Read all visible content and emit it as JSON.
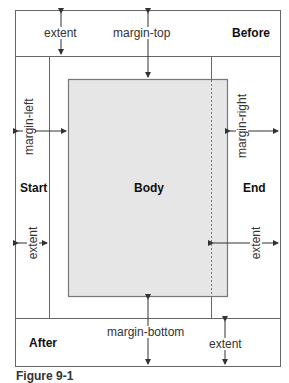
{
  "diagram": {
    "regions": {
      "before": "Before",
      "start": "Start",
      "body": "Body",
      "end": "End",
      "after": "After"
    },
    "dimensions": {
      "margin_top": "margin-top",
      "margin_bottom": "margin-bottom",
      "margin_left": "margin-left",
      "margin_right": "margin-right",
      "extent_before": "extent",
      "extent_start": "extent",
      "extent_end": "extent",
      "extent_after": "extent"
    },
    "caption": "Figure 9-1",
    "colors": {
      "line": "#555555",
      "body_fill": "#e6e6e6",
      "body_border": "#777777"
    }
  }
}
